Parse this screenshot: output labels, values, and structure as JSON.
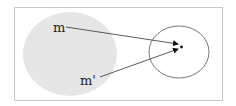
{
  "diagram": {
    "type": "mapping-diagram",
    "frame": {
      "x": 14,
      "y": 7,
      "width": 208,
      "height": 93,
      "stroke": "#c8c8c8"
    },
    "source_region": {
      "shape": "ellipse",
      "cx": 70,
      "cy": 54,
      "rx": 47,
      "ry": 42,
      "fill": "#e6e6e6"
    },
    "target_region": {
      "shape": "ellipse",
      "cx": 179,
      "cy": 52,
      "rx": 30,
      "ry": 26,
      "stroke": "#555555",
      "fill": "none"
    },
    "target_point": {
      "cx": 181,
      "cy": 47,
      "r": 1.4,
      "fill": "#111111"
    },
    "nodes": [
      {
        "id": "m",
        "label": "m",
        "x": 53,
        "y": 32
      },
      {
        "id": "m_prime",
        "label": "m'",
        "x": 80,
        "y": 85
      }
    ],
    "edges": [
      {
        "from": "m",
        "x1": 66,
        "y1": 27,
        "x2": 178,
        "y2": 44
      },
      {
        "from": "m_prime",
        "x1": 100,
        "y1": 77,
        "x2": 178,
        "y2": 49
      }
    ],
    "colors": {
      "line": "#333333",
      "arrowhead": "#111111"
    }
  }
}
